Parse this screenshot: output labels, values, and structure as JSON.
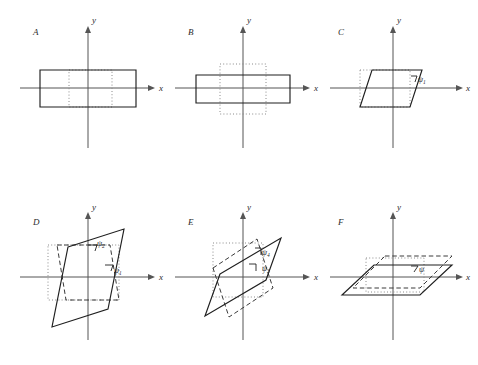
{
  "figure": {
    "background_color": "#ffffff",
    "stroke_color": "#1f1f1f",
    "axis_color": "#555555",
    "dotted_color": "#8a8a8a",
    "dashed_color": "#3a3a3a"
  },
  "axis_labels": {
    "x": "x",
    "y": "y"
  },
  "panels": [
    {
      "id": "A",
      "letter": "A",
      "origin": [
        88,
        88
      ],
      "x_axis": [
        20,
        152
      ],
      "y_axis": [
        18,
        148
      ],
      "solid_shape": "rectangle",
      "solid_points": "40,70 136,70 136,107 40,107",
      "dotted_points": "69,70 112,70 112,107 69,107",
      "angles": []
    },
    {
      "id": "B",
      "letter": "B",
      "origin": [
        243,
        88
      ],
      "x_axis": [
        175,
        307
      ],
      "y_axis": [
        18,
        148
      ],
      "solid_shape": "rectangle",
      "solid_points": "196,75 290,75 290,103 196,103",
      "dotted_points": "220,64 266,64 266,114 220,114",
      "angles": []
    },
    {
      "id": "C",
      "letter": "C",
      "origin": [
        393,
        88
      ],
      "x_axis": [
        330,
        462
      ],
      "y_axis": [
        18,
        148
      ],
      "solid_shape": "parallelogram",
      "solid_points": "372,70 422,70 410,107 360,107",
      "dotted_points": "360,70 410,70 410,107 360,107",
      "angles": [
        {
          "label": "ψ",
          "sub": "1",
          "x": 418,
          "y": 81
        }
      ]
    },
    {
      "id": "D",
      "letter": "D",
      "origin": [
        88,
        277
      ],
      "x_axis": [
        20,
        152
      ],
      "y_axis": [
        205,
        340
      ],
      "solid_shape": "steep-parallelogram",
      "solid_points": "68,247 124,229 108,309 52,327",
      "dashed_points": "57,245 110,245 119,300 66,300",
      "dotted_points": "48,245 119,245 119,300 48,300",
      "angles": [
        {
          "label": "ψ",
          "sub": "2",
          "x": 99,
          "y": 246
        },
        {
          "label": "ψ",
          "sub": "1",
          "x": 119,
          "y": 272
        }
      ]
    },
    {
      "id": "E",
      "letter": "E",
      "origin": [
        243,
        277
      ],
      "x_axis": [
        175,
        307
      ],
      "y_axis": [
        205,
        340
      ],
      "solid_shape": "wide-parallelogram",
      "solid_points": "220,274 281,238 266,280 205,316",
      "dashed_points": "213,268 257,239 273,288 229,317",
      "dotted_points": "213,243 263,243 263,297 213,297",
      "angles": [
        {
          "label": "ψ",
          "sub": "4",
          "x": 263,
          "y": 254
        },
        {
          "label": "ψ",
          "sub": "3",
          "x": 272,
          "y": 270
        }
      ]
    },
    {
      "id": "F",
      "letter": "F",
      "origin": [
        393,
        277
      ],
      "x_axis": [
        330,
        462
      ],
      "y_axis": [
        205,
        340
      ],
      "solid_shape": "flat-parallelogram",
      "solid_points": "374,265 452,265 420,295 342,295",
      "dashed_points": "385,256 452,256 420,288 353,288",
      "dotted_points": "366,258 424,258 424,292 366,292",
      "angles": [
        {
          "label": "ψ",
          "sub": "",
          "x": 420,
          "y": 270
        }
      ]
    }
  ]
}
